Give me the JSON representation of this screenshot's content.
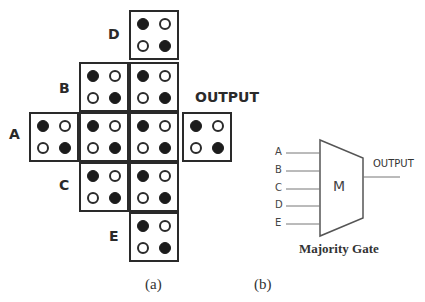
{
  "panel_a": {
    "labels": {
      "A": "A",
      "B": "B",
      "C": "C",
      "D": "D",
      "E": "E",
      "output": "OUTPUT"
    },
    "cell_pattern": {
      "top_left": "filled",
      "top_right": "hollow",
      "bottom_left": "hollow",
      "bottom_right": "filled"
    },
    "cells": [
      {
        "id": "D",
        "row": 0,
        "col": 2
      },
      {
        "id": "B1",
        "row": 1,
        "col": 1
      },
      {
        "id": "B2",
        "row": 1,
        "col": 2
      },
      {
        "id": "A",
        "row": 2,
        "col": 0
      },
      {
        "id": "M1",
        "row": 2,
        "col": 1
      },
      {
        "id": "M2",
        "row": 2,
        "col": 2
      },
      {
        "id": "OUT",
        "row": 2,
        "col": 3
      },
      {
        "id": "C1",
        "row": 3,
        "col": 1
      },
      {
        "id": "C2",
        "row": 3,
        "col": 2
      },
      {
        "id": "E",
        "row": 4,
        "col": 2
      }
    ],
    "caption": "(a)"
  },
  "panel_b": {
    "inputs": [
      "A",
      "B",
      "C",
      "D",
      "E"
    ],
    "gate_label": "M",
    "output_label": "OUTPUT",
    "title": "Majority Gate",
    "caption": "(b)"
  }
}
